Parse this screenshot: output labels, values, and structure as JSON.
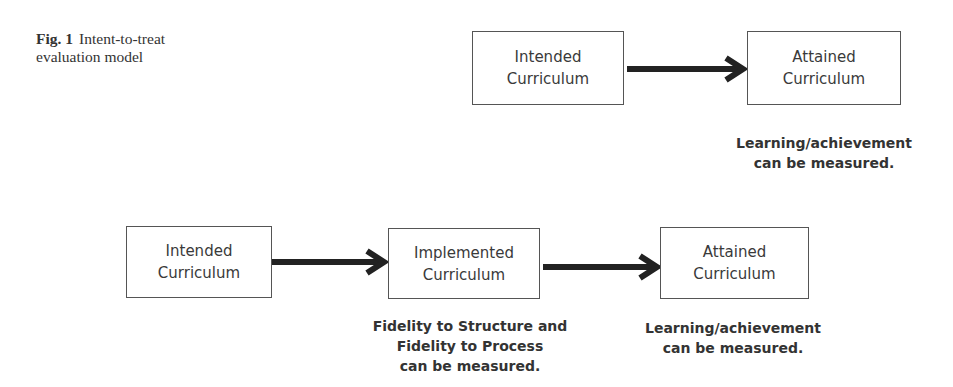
{
  "caption": {
    "figure_label": "Fig. 1",
    "title_line1": "Intent-to-treat",
    "title_line2": "evaluation model"
  },
  "top_model": {
    "boxes": [
      {
        "line1": "Intended",
        "line2": "Curriculum"
      },
      {
        "line1": "Attained",
        "line2": "Curriculum"
      }
    ],
    "note": {
      "line1": "Learning/achievement",
      "line2": "can be measured."
    }
  },
  "bottom_model": {
    "boxes": [
      {
        "line1": "Intended",
        "line2": "Curriculum"
      },
      {
        "line1": "Implemented",
        "line2": "Curriculum"
      },
      {
        "line1": "Attained",
        "line2": "Curriculum"
      }
    ],
    "notes": [
      {
        "line1": "Fidelity to Structure and",
        "line2": "Fidelity to Process",
        "line3": "can be measured."
      },
      {
        "line1": "Learning/achievement",
        "line2": "can be measured."
      }
    ]
  },
  "colors": {
    "border": "#555555",
    "arrow": "#222222",
    "text": "#333333"
  }
}
